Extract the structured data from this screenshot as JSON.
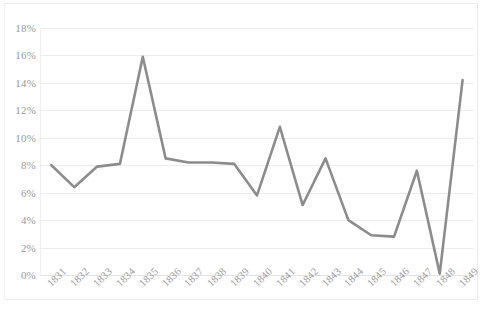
{
  "chart_data": {
    "type": "line",
    "title": "",
    "subtitle": "",
    "xlabel": "",
    "ylabel": "",
    "categories": [
      "1831",
      "1832",
      "1833",
      "1834",
      "1835",
      "1836",
      "1837",
      "1838",
      "1839",
      "1840",
      "1841",
      "1842",
      "1843",
      "1844",
      "1845",
      "1846",
      "1847",
      "1848",
      "1849"
    ],
    "values": [
      8.0,
      6.4,
      7.9,
      8.1,
      15.9,
      8.5,
      8.2,
      8.2,
      8.1,
      5.8,
      10.8,
      5.1,
      8.5,
      4.0,
      2.9,
      2.8,
      7.6,
      0.1,
      14.2
    ],
    "series": [
      {
        "name": "series-1",
        "values": [
          8.0,
          6.4,
          7.9,
          8.1,
          15.9,
          8.5,
          8.2,
          8.2,
          8.1,
          5.8,
          10.8,
          5.1,
          8.5,
          4.0,
          2.9,
          2.8,
          7.6,
          0.1,
          14.2
        ],
        "color": "#8c8c8c"
      }
    ],
    "ylim": [
      0,
      18
    ],
    "ytick_values": [
      0,
      2,
      4,
      6,
      8,
      10,
      12,
      14,
      16,
      18
    ],
    "ytick_labels": [
      "0%",
      "2%",
      "4%",
      "6%",
      "8%",
      "10%",
      "12%",
      "14%",
      "16%",
      "18%"
    ],
    "xtick_labels": [
      "1831",
      "1832",
      "1833",
      "1834",
      "1835",
      "1836",
      "1837",
      "1838",
      "1839",
      "1840",
      "1841",
      "1842",
      "1843",
      "1844",
      "1845",
      "1846",
      "1847",
      "1848",
      "1849"
    ],
    "xtick_rotation": -45,
    "grid": true,
    "grid_axis": "y",
    "legend": false,
    "legend_position": "none",
    "line_color": "#8c8c8c",
    "grid_color": "#ededf0",
    "tick_label_color": "#9a9a9a",
    "background_color": "#ffffff",
    "markers": false,
    "line_width": 2.6,
    "annotations": []
  },
  "caption": {
    "text": ""
  }
}
